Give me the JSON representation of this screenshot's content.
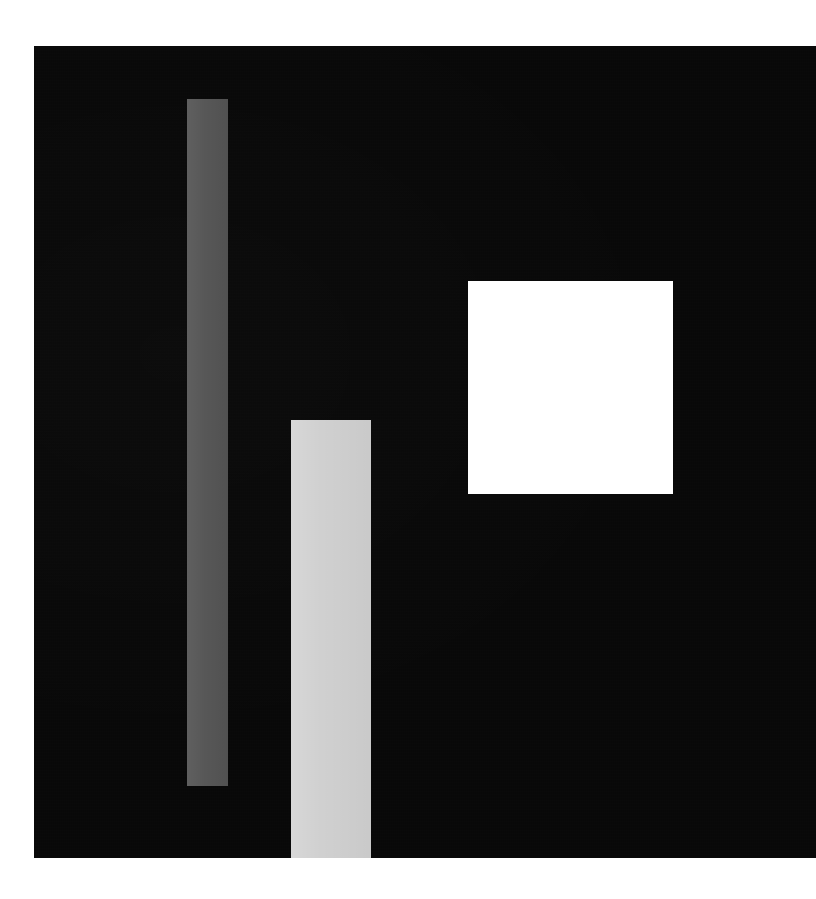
{
  "scene": {
    "title": "Abstract geometric composition",
    "frame_width": 816,
    "frame_height": 899,
    "background_color": "#ffffff"
  },
  "panel": {
    "name": "dark backdrop panel",
    "color": "#080808",
    "x": 34,
    "y": 46,
    "width": 782,
    "height": 812
  },
  "shapes": [
    {
      "id": "bar-dark-gray",
      "label": "tall medium-gray vertical bar",
      "form": "rectangle",
      "color": "#575757",
      "x": 187,
      "y": 99,
      "width": 41,
      "height": 687
    },
    {
      "id": "bar-light-gray",
      "label": "light-gray vertical bar",
      "form": "rectangle",
      "color": "#d0d0d0",
      "x": 291,
      "y": 420,
      "width": 80,
      "height": 438
    },
    {
      "id": "square-white",
      "label": "white square",
      "form": "square",
      "color": "#ffffff",
      "x": 468,
      "y": 281,
      "width": 205,
      "height": 213
    }
  ],
  "chart_data": {
    "type": "bar",
    "title": "",
    "xlabel": "",
    "ylabel": "",
    "categories": [
      "bar-dark-gray",
      "bar-light-gray"
    ],
    "values": [
      687,
      438
    ],
    "value_units": "pixels of bar height",
    "colors": [
      "#575757",
      "#d0d0d0"
    ],
    "background": "#080808",
    "grid": false,
    "legend": "none"
  }
}
